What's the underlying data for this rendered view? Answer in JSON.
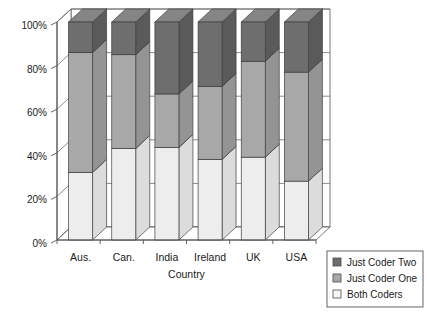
{
  "chart_data": {
    "type": "bar",
    "subtype": "100% stacked column (3D)",
    "title": "",
    "xlabel": "Country",
    "ylabel": "",
    "categories": [
      "Aus.",
      "Can.",
      "India",
      "Ireland",
      "UK",
      "USA"
    ],
    "series": [
      {
        "name": "Both Coders",
        "color": "#ededed",
        "values": [
          31,
          42,
          42.5,
          37,
          38,
          27
        ]
      },
      {
        "name": "Just Coder One",
        "color": "#a8a8a8",
        "values": [
          55,
          43,
          24.5,
          33.5,
          44,
          50
        ]
      },
      {
        "name": "Just Coder Two",
        "color": "#6e6e6e",
        "values": [
          14,
          15,
          33,
          29.5,
          18,
          23
        ]
      }
    ],
    "cumulative_boundaries": {
      "Aus.": [
        31,
        86,
        100
      ],
      "Can.": [
        42,
        85,
        100
      ],
      "India": [
        42.5,
        67,
        100
      ],
      "Ireland": [
        37,
        70.5,
        100
      ],
      "UK": [
        38,
        82,
        100
      ],
      "USA": [
        27,
        77,
        100
      ]
    },
    "ylim": [
      0,
      100
    ],
    "ytick_values": [
      0,
      20,
      40,
      60,
      80,
      100
    ],
    "ytick_labels": [
      "0%",
      "20%",
      "40%",
      "60%",
      "80%",
      "100%"
    ],
    "grid": true,
    "legend_position": "bottom-right",
    "legend_entries": [
      "Just Coder Two",
      "Just Coder One",
      "Both Coders"
    ]
  },
  "axes": {
    "x_title": "Country",
    "y_ticks": [
      "100%",
      "80%",
      "60%",
      "40%",
      "20%",
      "0%"
    ]
  },
  "legend": {
    "items": [
      {
        "label": "Just Coder Two",
        "swatch": "#6e6e6e"
      },
      {
        "label": "Just Coder One",
        "swatch": "#a8a8a8"
      },
      {
        "label": "Both Coders",
        "swatch": "#f7f7f7"
      }
    ]
  },
  "style": {
    "dark": "#6e6e6e",
    "dark_top": "#858585",
    "dark_side": "#5a5a5a",
    "mid": "#a8a8a8",
    "mid_top": "#bdbdbd",
    "mid_side": "#949494",
    "light": "#ededed",
    "light_top": "#f8f8f8",
    "light_side": "#dcdcdc",
    "axis": "#555555",
    "grid": "#6f6f6f",
    "wall": "#ffffff",
    "floor": "#ffffff",
    "legend_border": "#555555"
  }
}
